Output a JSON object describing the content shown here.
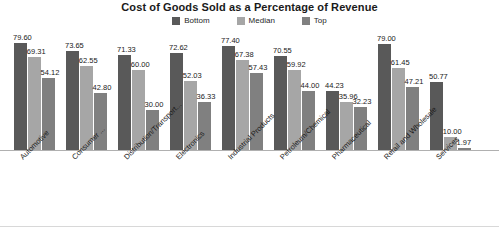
{
  "chart_data": {
    "type": "bar",
    "title": "Cost of Goods Sold as a Percentage of Revenue",
    "xlabel": "",
    "ylabel": "",
    "ylim": [
      0,
      85
    ],
    "grid": false,
    "legend_position": "top-center",
    "categories": [
      "Automotive",
      "Consumer ...",
      "Distribution/Transport...",
      "Electronics",
      "Industrial Products",
      "Petroleum/Chemical",
      "Pharmaceutical",
      "Retail and Wholesale",
      "Services"
    ],
    "series": [
      {
        "name": "Bottom",
        "color": "#595959",
        "values": [
          79.6,
          73.65,
          71.33,
          72.62,
          77.4,
          70.55,
          44.23,
          79.0,
          50.77
        ],
        "labels": [
          "79.60",
          "73.65",
          "71.33",
          "72.62",
          "77.40",
          "70.55",
          "44.23",
          "79.00",
          "50.77"
        ]
      },
      {
        "name": "Median",
        "color": "#a6a6a6",
        "values": [
          69.31,
          62.55,
          60.0,
          52.03,
          67.38,
          59.92,
          35.96,
          61.45,
          10.0
        ],
        "labels": [
          "69.31",
          "62.55",
          "60.00",
          "52.03",
          "67.38",
          "59.92",
          "35.96",
          "61.45",
          "10.00"
        ]
      },
      {
        "name": "Top",
        "color": "#808080",
        "values": [
          54.12,
          42.8,
          30.0,
          36.33,
          57.43,
          44.0,
          32.23,
          47.21,
          1.97
        ],
        "labels": [
          "54.12",
          "42.80",
          "30.00",
          "36.33",
          "57.43",
          "44.00",
          "32.23",
          "47.21",
          "1.97"
        ]
      }
    ]
  },
  "legend": {
    "items": [
      {
        "label": "Bottom",
        "color": "#595959"
      },
      {
        "label": "Median",
        "color": "#a6a6a6"
      },
      {
        "label": "Top",
        "color": "#808080"
      }
    ]
  }
}
